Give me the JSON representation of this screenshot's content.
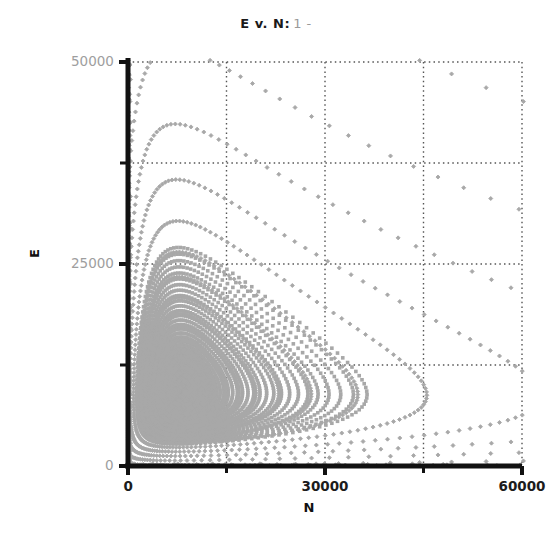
{
  "chart_data": {
    "type": "scatter",
    "title_main": "E v. N:",
    "title_suffix": "1 -",
    "xlabel": "N",
    "ylabel": "E",
    "xlim": [
      0,
      60000
    ],
    "ylim": [
      0,
      50000
    ],
    "x_major_ticks": [
      0,
      30000,
      60000
    ],
    "x_major_tick_labels": [
      "0",
      "30000",
      "60000"
    ],
    "x_minor_ticks": [
      15000,
      45000
    ],
    "y_major_ticks": [
      0,
      25000,
      50000
    ],
    "y_major_tick_labels": [
      "0",
      "25000",
      "50000"
    ],
    "y_minor_ticks": [
      12500,
      37500
    ],
    "grid": true,
    "grid_style": "dotted",
    "grid_color": "#555555",
    "marker": "diamond",
    "marker_color": "#a8a8a8",
    "marker_size": 4,
    "axis_color": "#111111",
    "background": "#ffffff",
    "fixed_point": {
      "N": 8200,
      "E": 9200
    },
    "series": [
      {
        "name": "orbit-1",
        "amplitude": 0.07,
        "n_points": 140
      },
      {
        "name": "orbit-2",
        "amplitude": 0.14,
        "n_points": 140
      },
      {
        "name": "orbit-3",
        "amplitude": 0.21,
        "n_points": 140
      },
      {
        "name": "orbit-4",
        "amplitude": 0.28,
        "n_points": 140
      },
      {
        "name": "orbit-5",
        "amplitude": 0.35,
        "n_points": 140
      },
      {
        "name": "orbit-6",
        "amplitude": 0.43,
        "n_points": 145
      },
      {
        "name": "orbit-7",
        "amplitude": 0.51,
        "n_points": 145
      },
      {
        "name": "orbit-8",
        "amplitude": 0.6,
        "n_points": 150
      },
      {
        "name": "orbit-9",
        "amplitude": 0.69,
        "n_points": 150
      },
      {
        "name": "orbit-10",
        "amplitude": 0.79,
        "n_points": 155
      },
      {
        "name": "orbit-11",
        "amplitude": 0.9,
        "n_points": 160
      },
      {
        "name": "orbit-12",
        "amplitude": 1.02,
        "n_points": 165
      },
      {
        "name": "orbit-13",
        "amplitude": 1.15,
        "n_points": 170
      },
      {
        "name": "orbit-14",
        "amplitude": 1.3,
        "n_points": 175
      },
      {
        "name": "orbit-15",
        "amplitude": 1.47,
        "n_points": 180
      },
      {
        "name": "orbit-16",
        "amplitude": 1.66,
        "n_points": 185
      },
      {
        "name": "orbit-17",
        "amplitude": 1.88,
        "n_points": 190
      },
      {
        "name": "orbit-18",
        "amplitude": 2.14,
        "n_points": 195
      },
      {
        "name": "orbit-19",
        "amplitude": 2.45,
        "n_points": 200
      },
      {
        "name": "orbit-20",
        "amplitude": 2.82,
        "n_points": 205
      },
      {
        "name": "orbit-21",
        "amplitude": 3.26,
        "n_points": 210
      },
      {
        "name": "orbit-22",
        "amplitude": 3.8,
        "n_points": 215
      }
    ],
    "geometry": {
      "left_px": 128,
      "right_px": 522,
      "top_px": 62,
      "bottom_px": 466
    }
  }
}
